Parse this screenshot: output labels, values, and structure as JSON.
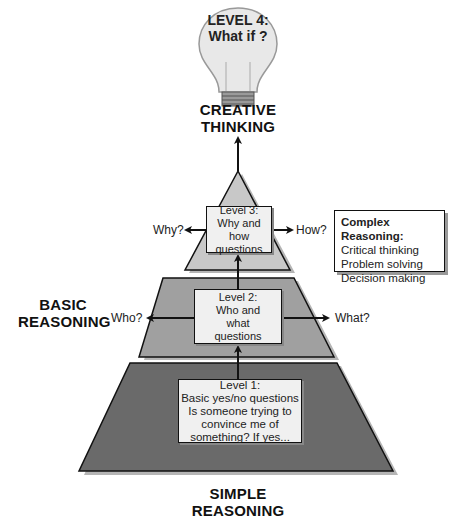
{
  "top": {
    "bulb_line1": "LEVEL 4:",
    "bulb_line2": "What if ?",
    "title_line1": "CREATIVE",
    "title_line2": "THINKING"
  },
  "level3": {
    "line1": "Level 3:",
    "line2": "Why and how",
    "line3": "questions",
    "left_question": "Why?",
    "right_question": "How?"
  },
  "complex": {
    "heading": "Complex Reasoning:",
    "items": [
      "Critical thinking",
      "Problem solving",
      "Decision making"
    ]
  },
  "level2": {
    "line1": "Level 2:",
    "line2": "Who and",
    "line3": "what",
    "line4": "questions",
    "left_question": "Who?",
    "right_question": "What?"
  },
  "basic": {
    "line1": "BASIC",
    "line2": "REASONING"
  },
  "level1": {
    "line1": "Level 1:",
    "line2": "Basic yes/no questions",
    "line3": "Is someone trying to",
    "line4": "convince me of",
    "line5": "something? If yes..."
  },
  "bottom": {
    "line1": "SIMPLE",
    "line2": "REASONING"
  },
  "colors": {
    "tier_top": "#c8c8c8",
    "tier_middle": "#a0a0a0",
    "tier_bottom": "#6a6a6a",
    "shadow": "#b5b5b5",
    "box_fill": "#f0f0f0"
  }
}
